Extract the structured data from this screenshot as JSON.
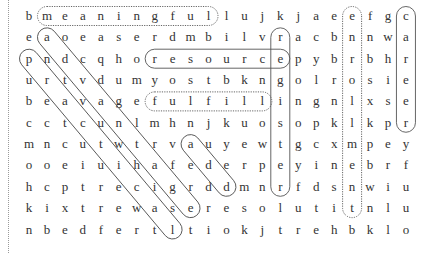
{
  "puzzle": {
    "rows": [
      "bmeaningfullujkjaeefgc",
      "eaoeaserdmbilvracbnnwa",
      "pndcqhoresourcepybrbhr",
      "urtvdumyostbkngolrosie",
      "beavagefulfillingnlxse",
      "cctcunlmhnjkuosopklkpr",
      "mncutwtrvauyewtgcxmpey",
      "ooeiuihafederpeyinebrf",
      "hcptrecigrddmnrfdsnwiu",
      "kixtrewaseresolutitnlu",
      "nbedfertltiokjtrehbklo"
    ],
    "found_words": [
      {
        "word": "meaningful",
        "direction": "horizontal",
        "start": [
          0,
          1
        ],
        "end": [
          0,
          10
        ],
        "style": "dotted"
      },
      {
        "word": "resource",
        "direction": "horizontal",
        "start": [
          2,
          7
        ],
        "end": [
          2,
          14
        ],
        "style": "solid"
      },
      {
        "word": "fulfill",
        "direction": "horizontal",
        "start": [
          4,
          7
        ],
        "end": [
          4,
          13
        ],
        "style": "dotted"
      },
      {
        "word": "register",
        "direction": "vertical",
        "start": [
          1,
          14
        ],
        "end": [
          8,
          14
        ],
        "style": "solid"
      },
      {
        "word": "enrollment",
        "direction": "vertical",
        "start": [
          0,
          18
        ],
        "end": [
          9,
          18
        ],
        "style": "dotted"
      },
      {
        "word": "career",
        "direction": "vertical",
        "start": [
          0,
          21
        ],
        "end": [
          5,
          21
        ],
        "style": "solid"
      },
      {
        "word": "advantage",
        "direction": "diagonal",
        "start": [
          1,
          1
        ],
        "end": [
          9,
          9
        ],
        "style": "solid"
      },
      {
        "word": "practical",
        "direction": "diagonal",
        "start": [
          2,
          0
        ],
        "end": [
          10,
          8
        ],
        "style": "solid"
      },
      {
        "word": "add",
        "direction": "diagonal",
        "start": [
          6,
          9
        ],
        "end": [
          8,
          11
        ],
        "style": "solid"
      }
    ]
  }
}
